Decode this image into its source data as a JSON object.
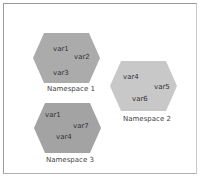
{
  "diagram": {
    "namespaces": [
      {
        "label": "Namespace 1",
        "color": "#ababab",
        "vars": [
          "var1",
          "var2",
          "var3"
        ]
      },
      {
        "label": "Namespace 2",
        "color": "#c8c8c8",
        "vars": [
          "var4",
          "var5",
          "var6"
        ]
      },
      {
        "label": "Namespace 3",
        "color": "#a3a3a3",
        "vars": [
          "var1",
          "var7",
          "var4"
        ]
      }
    ]
  }
}
